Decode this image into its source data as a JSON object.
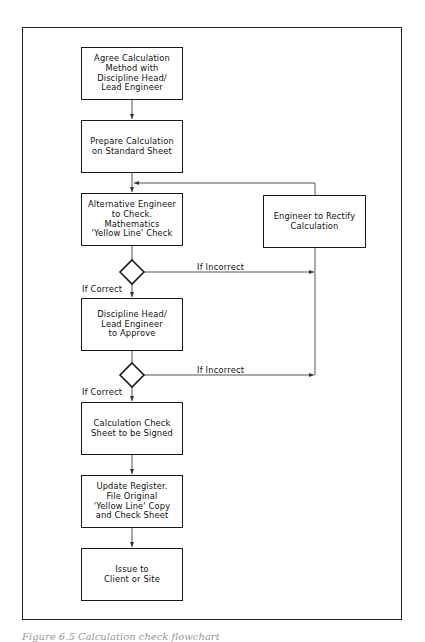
{
  "flowchart": {
    "steps": [
      {
        "id": "agree-method",
        "text": "Agree Calculation\nMethod with\nDiscipline Head/\nLead Engineer"
      },
      {
        "id": "prepare-calc",
        "text": "Prepare Calculation\non Standard Sheet"
      },
      {
        "id": "alt-engineer-check",
        "text": "Alternative Engineer\nto Check.\nMathematics\n'Yellow Line' Check"
      },
      {
        "id": "head-approve",
        "text": "Discipline Head/\nLead Engineer\nto Approve"
      },
      {
        "id": "check-sheet-signed",
        "text": "Calculation Check\nSheet to be Signed"
      },
      {
        "id": "update-register",
        "text": "Update Register.\nFile Original\n'Yellow Line' Copy\nand Check Sheet"
      },
      {
        "id": "issue-client",
        "text": "Issue to\nClient or Site"
      }
    ],
    "rectify": {
      "id": "engineer-rectify",
      "text": "Engineer to Rectify\nCalculation"
    },
    "decisions": [
      {
        "correct_label": "If Correct",
        "incorrect_label": "If Incorrect"
      },
      {
        "correct_label": "If Correct",
        "incorrect_label": "If Incorrect"
      }
    ],
    "line_color": "#1a1a1a",
    "connector_color": "#555555"
  },
  "caption": "Figure 6.5  Calculation check flowchart"
}
